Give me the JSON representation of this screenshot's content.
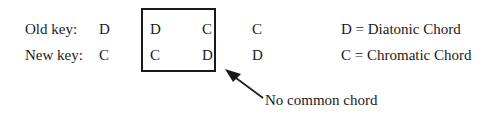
{
  "rows": {
    "old": {
      "label": "Old key:",
      "chords": [
        "D",
        "D",
        "C",
        "C"
      ]
    },
    "new": {
      "label": "New key:",
      "chords": [
        "C",
        "C",
        "D",
        "D"
      ]
    }
  },
  "legend": {
    "diatonic": "D = Diatonic Chord",
    "chromatic": "C = Chromatic Chord"
  },
  "annotation": "No common chord"
}
